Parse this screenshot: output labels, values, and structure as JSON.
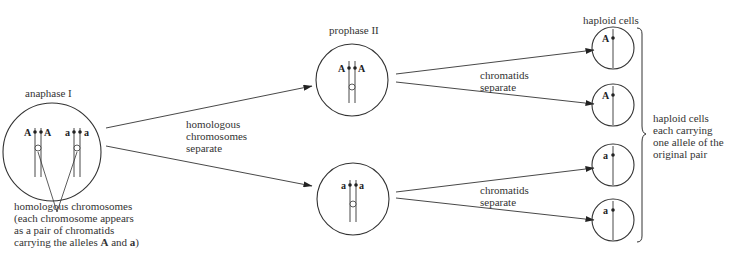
{
  "diagram": {
    "stages": {
      "anaphase_i": {
        "label": "anaphase I",
        "alleles_left": [
          "A",
          "A"
        ],
        "alleles_right": [
          "a",
          "a"
        ]
      },
      "prophase_ii": {
        "label": "prophase II",
        "top_alleles": [
          "A",
          "A"
        ],
        "bottom_alleles": [
          "a",
          "a"
        ]
      },
      "haploid": {
        "label": "haploid cells",
        "cells": [
          {
            "allele": "A"
          },
          {
            "allele": "A"
          },
          {
            "allele": "a"
          },
          {
            "allele": "a"
          }
        ]
      }
    },
    "arrows": {
      "meiosis_i": {
        "line1": "homologous",
        "line2": "chromosomes",
        "line3": "separate"
      },
      "meiosis_ii_top": {
        "line1": "chromatids",
        "line2": "separate"
      },
      "meiosis_ii_bottom": {
        "line1": "chromatids",
        "line2": "separate"
      }
    },
    "annotation": {
      "line1": "homologous chromosomes",
      "line2": "(each chromosome appears",
      "line3": "as a pair of chromatids",
      "line4_prefix": "carrying the alleles ",
      "line4_A": "A",
      "line4_and": " and ",
      "line4_a": "a",
      "line4_suffix": ")"
    },
    "bracket_note": {
      "line1": "haploid cells",
      "line2": "each carrying",
      "line3": "one allele of the",
      "line4": "original pair"
    }
  }
}
